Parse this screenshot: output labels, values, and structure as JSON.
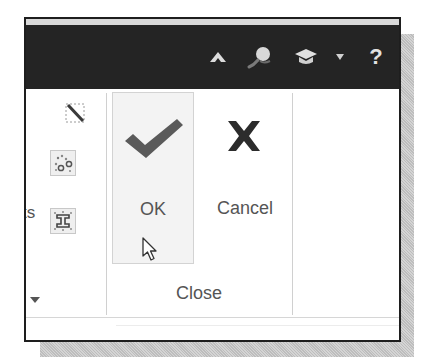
{
  "topbar": {
    "icons": [
      {
        "name": "collapse-ribbon-icon",
        "glyph": "caret-up"
      },
      {
        "name": "search-icon",
        "glyph": "magnifier"
      },
      {
        "name": "learning-icon",
        "glyph": "graduation-cap"
      },
      {
        "name": "dropdown-arrow-icon",
        "glyph": "caret-down"
      },
      {
        "name": "help-icon",
        "glyph": "?"
      }
    ],
    "help_label": "?"
  },
  "ribbon": {
    "left_group": {
      "partial_label": "ts",
      "tools": [
        {
          "name": "tool-sketch-edit",
          "boxed": false
        },
        {
          "name": "tool-scatter-points",
          "boxed": true
        },
        {
          "name": "tool-constraint",
          "boxed": true
        }
      ]
    },
    "close_group": {
      "label": "Close",
      "buttons": [
        {
          "id": "ok",
          "label": "OK",
          "icon": "checkmark-icon",
          "hovered": true
        },
        {
          "id": "cancel",
          "label": "Cancel",
          "icon": "x-icon"
        }
      ]
    }
  },
  "colors": {
    "topbar_bg": "#242424",
    "icon_light": "#dcdcdc",
    "checkmark": "#5a5a5a",
    "x_mark": "#2c2c2c",
    "label_text": "#555555",
    "hover_bg": "#f3f3f3"
  }
}
